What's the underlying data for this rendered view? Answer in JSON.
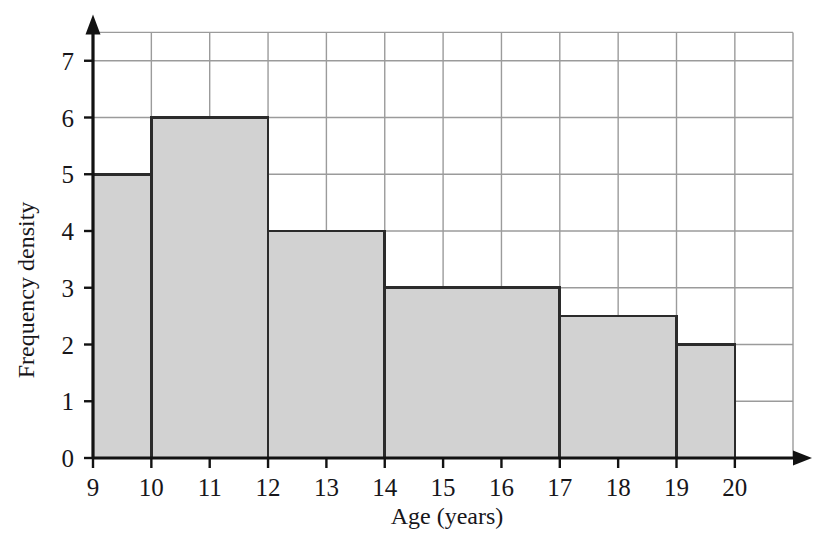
{
  "chart_data": {
    "type": "bar",
    "title": "",
    "subtitle": "",
    "xlabel": "Age (years)",
    "ylabel": "Frequency density",
    "xlim": [
      9,
      20
    ],
    "ylim": [
      0,
      7.5
    ],
    "grid": true,
    "legend": null,
    "xticks": [
      "9",
      "10",
      "11",
      "12",
      "13",
      "14",
      "15",
      "16",
      "17",
      "18",
      "19",
      "20"
    ],
    "xtick_values": [
      9,
      10,
      11,
      12,
      13,
      14,
      15,
      16,
      17,
      18,
      19,
      20
    ],
    "yticks": [
      "0",
      "1",
      "2",
      "3",
      "4",
      "5",
      "6",
      "7"
    ],
    "ytick_values": [
      0,
      1,
      2,
      3,
      4,
      5,
      6,
      7
    ],
    "bar_fill_color": "#d2d2d2",
    "bar_edge_color": "#2b2b2b",
    "grid_color": "#9b9b9b",
    "axis_color": "#121212",
    "categories": [
      "9-10",
      "10-12",
      "12-14",
      "14-17",
      "17-19",
      "19-20"
    ],
    "values": [
      5,
      6,
      4,
      3,
      2.5,
      2
    ],
    "bars": [
      {
        "label": "9-10",
        "x0": 9,
        "x1": 10,
        "height": 5,
        "frequency": 5
      },
      {
        "label": "10-12",
        "x0": 10,
        "x1": 12,
        "height": 6,
        "frequency": 12
      },
      {
        "label": "12-14",
        "x0": 12,
        "x1": 14,
        "height": 4,
        "frequency": 8
      },
      {
        "label": "14-17",
        "x0": 14,
        "x1": 17,
        "height": 3,
        "frequency": 9
      },
      {
        "label": "17-19",
        "x0": 17,
        "x1": 19,
        "height": 2.5,
        "frequency": 5
      },
      {
        "label": "19-20",
        "x0": 19,
        "x1": 20,
        "height": 2,
        "frequency": 2
      }
    ]
  }
}
